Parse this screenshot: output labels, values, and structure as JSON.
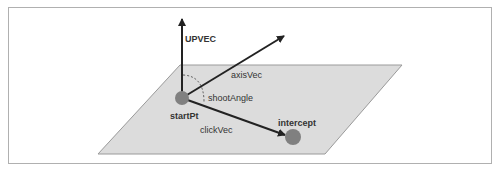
{
  "diagram": {
    "labels": {
      "up_vector": "UPVEC",
      "axis_vector": "axisVec",
      "shoot_angle": "shootAngle",
      "start_point": "startPt",
      "click_vector": "clickVec",
      "intercept": "intercept"
    },
    "colors": {
      "plane_fill": "#dcdcdc",
      "plane_stroke": "#9a9a9a",
      "arrow": "#222222",
      "point": "#808080",
      "frame": "#b0b0b0"
    }
  }
}
